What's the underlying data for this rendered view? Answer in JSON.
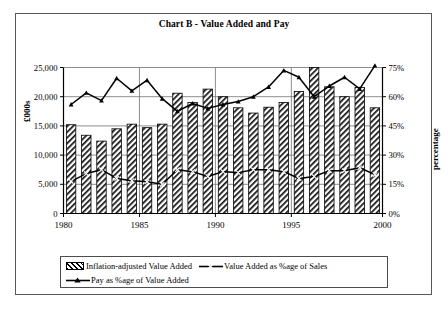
{
  "frame": {
    "border_color": "#55585c"
  },
  "title": "Chart B - Value Added and Pay",
  "axes": {
    "y_left_title": "£000s",
    "y_right_title": "percentage",
    "y_left_ticks": [
      "0",
      "5,000",
      "10,000",
      "15,000",
      "20,000",
      "25,000"
    ],
    "y_right_ticks": [
      "0%",
      "15%",
      "30%",
      "45%",
      "60%",
      "75%"
    ],
    "x_ticks": [
      "1980",
      "1985",
      "1990",
      "1995",
      "2000"
    ]
  },
  "legend": {
    "items": [
      {
        "label": "Inflation-adjusted Value Added",
        "marker": "bar-hatch-swatch"
      },
      {
        "label": "Value Added as %age of Sales",
        "marker": "line-x-marker-swatch"
      },
      {
        "label": "Pay as %age of Value Added",
        "marker": "line-triangle-marker-swatch"
      }
    ]
  },
  "chart_data": {
    "type": "bar",
    "title": "Chart B - Value Added and Pay",
    "xlabel": "",
    "ylabel": "£000s",
    "y2label": "percentage",
    "ylim": [
      0,
      25000
    ],
    "y2lim": [
      0,
      75
    ],
    "grid": true,
    "legend_position": "bottom",
    "categories": [
      "1980",
      "1981",
      "1982",
      "1983",
      "1984",
      "1985",
      "1986",
      "1987",
      "1988",
      "1989",
      "1990",
      "1991",
      "1992",
      "1993",
      "1994",
      "1995",
      "1996",
      "1997",
      "1998",
      "1999",
      "2000"
    ],
    "series": [
      {
        "name": "Inflation-adjusted Value Added",
        "type": "bar",
        "axis": "left",
        "unit": "£000s",
        "values": [
          15200,
          13400,
          12400,
          14500,
          15300,
          14700,
          15300,
          20600,
          19000,
          21300,
          20000,
          18100,
          17200,
          18200,
          19000,
          20900,
          25000,
          21700,
          20000,
          21600,
          18100
        ]
      },
      {
        "name": "Value Added as %age of Sales",
        "type": "line",
        "axis": "right",
        "unit": "%",
        "values": [
          16.5,
          20.5,
          22.5,
          18.0,
          16.8,
          16.3,
          15.0,
          22.5,
          21.5,
          19.0,
          21.5,
          21.0,
          22.5,
          22.5,
          21.5,
          18.0,
          19.0,
          22.0,
          22.0,
          23.5,
          20.0
        ]
      },
      {
        "name": "Pay as %age of Value Added",
        "type": "line",
        "axis": "right",
        "unit": "%",
        "values": [
          56.0,
          62.0,
          58.0,
          69.5,
          63.0,
          68.5,
          59.0,
          52.5,
          56.5,
          54.0,
          56.0,
          57.5,
          60.0,
          65.0,
          73.5,
          70.0,
          60.0,
          65.5,
          70.0,
          64.0,
          76.0
        ]
      }
    ]
  }
}
